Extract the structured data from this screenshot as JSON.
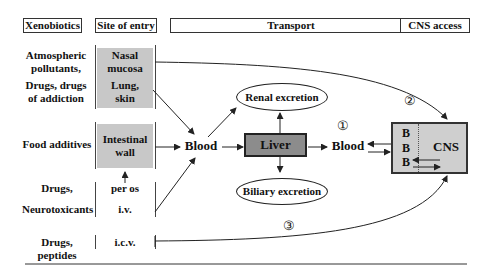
{
  "headers": {
    "xenobiotics": "Xenobiotics",
    "site_of_entry": "Site of entry",
    "transport": "Transport",
    "cns_access": "CNS access"
  },
  "xenobiotics": {
    "atmospheric": [
      "Atmospheric",
      "pollutants,"
    ],
    "drugs_addiction": [
      "Drugs, drugs",
      "of addiction"
    ],
    "food": "Food additives",
    "drugs": "Drugs,",
    "neurotoxicants": "Neurotoxicants",
    "drugs_peptides": "Drugs, peptides"
  },
  "sites": {
    "nasal": [
      "Nasal",
      "mucosa"
    ],
    "lung": [
      "Lung,",
      "skin"
    ],
    "intestinal": [
      "Intestinal",
      "wall"
    ],
    "per_os": "per os",
    "iv": "i.v.",
    "icv": "i.c.v."
  },
  "transport": {
    "blood1": "Blood",
    "liver": "Liver",
    "blood2": "Blood",
    "renal": "Renal excretion",
    "biliary": "Biliary excretion"
  },
  "cns": {
    "bbb": [
      "B",
      "B",
      "B"
    ],
    "label": "CNS"
  },
  "routes": {
    "r1": "①",
    "r2": "②",
    "r3": "③"
  },
  "colors": {
    "entry_fill": "#c8c8c8",
    "liver_fill": "#8c8c8c",
    "cns_fill": "#cfcfcf",
    "line": "#222222"
  }
}
